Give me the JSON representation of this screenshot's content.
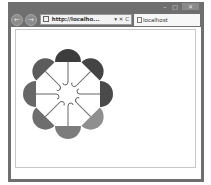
{
  "browser": {
    "window_controls": {
      "minimize": "–",
      "maximize": "□",
      "close": "✕"
    },
    "nav": {
      "back_icon": "←",
      "forward_icon": "→"
    },
    "address_bar": {
      "url": "http://localho...",
      "tools": "▾ ✕ C"
    },
    "tab": {
      "title": "localhost"
    }
  },
  "page": {
    "spinner": {
      "type": "umbrella-loading-spinner",
      "count": 8,
      "center": [
        57,
        67
      ],
      "umbrellas": [
        {
          "angle": 0,
          "color": "#3d3d3d"
        },
        {
          "angle": 45,
          "color": "#444444"
        },
        {
          "angle": 90,
          "color": "#4a4a4a"
        },
        {
          "angle": 135,
          "color": "#8f8f8f"
        },
        {
          "angle": 180,
          "color": "#7c7c7c"
        },
        {
          "angle": 225,
          "color": "#6e6e6e"
        },
        {
          "angle": 270,
          "color": "#676767"
        },
        {
          "angle": 315,
          "color": "#5c5c5c"
        }
      ]
    }
  }
}
